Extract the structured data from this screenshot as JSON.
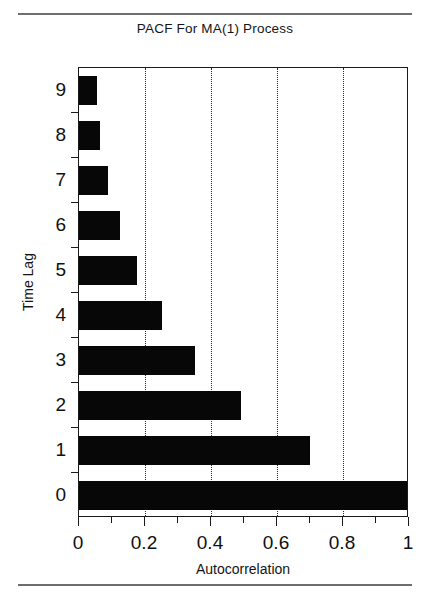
{
  "chart_data": {
    "type": "bar",
    "orientation": "horizontal",
    "title": "PACF For MA(1) Process",
    "xlabel": "Autocorrelation",
    "ylabel": "Time Lag",
    "categories": [
      "0",
      "1",
      "2",
      "3",
      "4",
      "5",
      "6",
      "7",
      "8",
      "9"
    ],
    "values": [
      1.0,
      0.7,
      0.49,
      0.35,
      0.25,
      0.175,
      0.125,
      0.088,
      0.065,
      0.055
    ],
    "series": [
      {
        "name": "Partial autocorrelation",
        "values": [
          1.0,
          0.7,
          0.49,
          0.35,
          0.25,
          0.175,
          0.125,
          0.088,
          0.065,
          0.055
        ]
      }
    ],
    "xlim": [
      0,
      1
    ],
    "xticks": [
      0,
      0.2,
      0.4,
      0.6,
      0.8,
      1
    ],
    "xtick_labels": [
      "0",
      "0.2",
      "0.4",
      "0.6",
      "0.8",
      "1"
    ],
    "xminor_ticks": [
      0.1,
      0.3,
      0.5,
      0.7,
      0.9
    ],
    "ytick_labels": [
      "0",
      "1",
      "2",
      "3",
      "4",
      "5",
      "6",
      "7",
      "8",
      "9"
    ],
    "grid": "vertical-dotted",
    "legend": null,
    "bar_color": "#070707",
    "axis_color": "#1a1a1a",
    "background": "#ffffff"
  }
}
